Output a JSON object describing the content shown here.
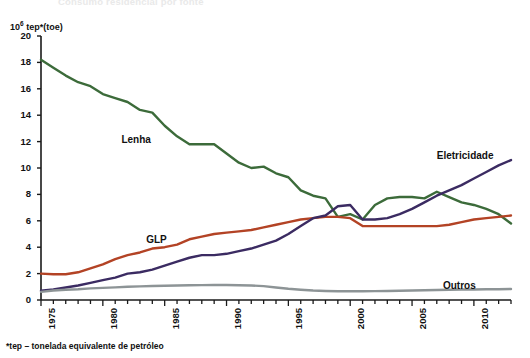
{
  "figure": {
    "cut_title": "Consumo residencial por fonte",
    "unit_label_prefix": "10",
    "unit_label_exponent": "6",
    "unit_label_suffix": " tep*(toe)",
    "footnote": "*tep – tonelada equivalente de petróleo"
  },
  "colors": {
    "lenha": "#3c6b3a",
    "glp": "#b34325",
    "eletricidade": "#3b2b62",
    "outros": "#8d9496",
    "axis": "#1a1a1a",
    "background": "#ffffff"
  },
  "chart_data": {
    "type": "line",
    "title": "Consumo residencial por fonte",
    "xlabel": "",
    "ylabel": "10^6 tep*(toe)",
    "xlim": [
      1975,
      2013
    ],
    "ylim": [
      0,
      20
    ],
    "ytick_labels": [
      "0",
      "2",
      "4",
      "6",
      "8",
      "10",
      "12",
      "14",
      "16",
      "18",
      "20"
    ],
    "ytick_values": [
      0,
      2,
      4,
      6,
      8,
      10,
      12,
      14,
      16,
      18,
      20
    ],
    "xtick_labels": [
      "1975",
      "1980",
      "1985",
      "1990",
      "1995",
      "2000",
      "2005",
      "2010"
    ],
    "xtick_values": [
      1975,
      1980,
      1985,
      1990,
      1995,
      2000,
      2005,
      2010
    ],
    "minor_xticks_every": 1,
    "grid": false,
    "legend_position": "inline-annotations",
    "x": [
      1975,
      1976,
      1977,
      1978,
      1979,
      1980,
      1981,
      1982,
      1983,
      1984,
      1985,
      1986,
      1987,
      1988,
      1989,
      1990,
      1991,
      1992,
      1993,
      1994,
      1995,
      1996,
      1997,
      1998,
      1999,
      2000,
      2001,
      2002,
      2003,
      2004,
      2005,
      2006,
      2007,
      2008,
      2009,
      2010,
      2011,
      2012,
      2013
    ],
    "series": [
      {
        "name": "Lenha",
        "color": "#3c6b3a",
        "label_x": 1981.5,
        "label_y": 12.6,
        "values": [
          18.2,
          17.6,
          17.0,
          16.5,
          16.2,
          15.6,
          15.3,
          15.0,
          14.4,
          14.2,
          13.2,
          12.4,
          11.8,
          11.8,
          11.8,
          11.1,
          10.4,
          10.0,
          10.1,
          9.6,
          9.3,
          8.3,
          7.9,
          7.7,
          6.3,
          6.5,
          6.1,
          7.2,
          7.7,
          7.8,
          7.8,
          7.7,
          8.2,
          7.8,
          7.4,
          7.2,
          6.9,
          6.5,
          5.8
        ]
      },
      {
        "name": "GLP",
        "color": "#b34325",
        "label_x": 1983.5,
        "label_y": 5.0,
        "values": [
          2.0,
          1.95,
          1.95,
          2.1,
          2.4,
          2.7,
          3.1,
          3.4,
          3.6,
          3.9,
          4.0,
          4.2,
          4.6,
          4.8,
          5.0,
          5.1,
          5.2,
          5.3,
          5.5,
          5.7,
          5.9,
          6.1,
          6.2,
          6.3,
          6.3,
          6.2,
          5.6,
          5.6,
          5.6,
          5.6,
          5.6,
          5.6,
          5.6,
          5.7,
          5.9,
          6.1,
          6.2,
          6.3,
          6.4
        ]
      },
      {
        "name": "Eletricidade",
        "color": "#3b2b62",
        "label_x": 2007.0,
        "label_y": 11.4,
        "values": [
          0.7,
          0.8,
          0.95,
          1.1,
          1.3,
          1.5,
          1.7,
          2.0,
          2.1,
          2.3,
          2.6,
          2.9,
          3.2,
          3.4,
          3.4,
          3.5,
          3.7,
          3.9,
          4.2,
          4.5,
          5.0,
          5.6,
          6.2,
          6.4,
          7.1,
          7.2,
          6.1,
          6.1,
          6.2,
          6.5,
          6.9,
          7.4,
          7.9,
          8.3,
          8.7,
          9.2,
          9.7,
          10.2,
          10.6
        ]
      },
      {
        "name": "Outros",
        "color": "#8d9496",
        "label_x": 2007.5,
        "label_y": 1.55,
        "values": [
          0.62,
          0.72,
          0.78,
          0.82,
          0.88,
          0.92,
          0.96,
          1.0,
          1.03,
          1.06,
          1.08,
          1.1,
          1.12,
          1.13,
          1.14,
          1.14,
          1.12,
          1.1,
          1.05,
          0.95,
          0.85,
          0.78,
          0.72,
          0.68,
          0.66,
          0.66,
          0.66,
          0.67,
          0.68,
          0.7,
          0.72,
          0.74,
          0.76,
          0.78,
          0.79,
          0.8,
          0.81,
          0.82,
          0.83
        ]
      }
    ]
  }
}
